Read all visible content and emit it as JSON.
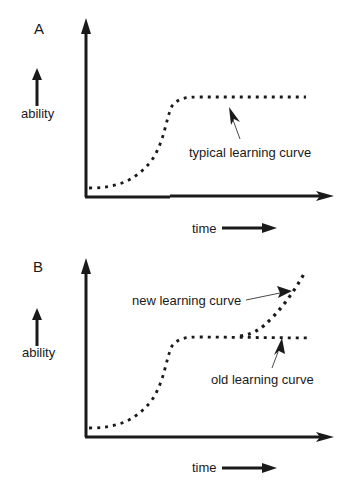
{
  "panels": [
    {
      "id": "A",
      "label": "A",
      "y_axis_label": "ability",
      "x_axis_label": "time",
      "annotations": [
        {
          "text": "typical learning curve",
          "points_to": "plateau"
        }
      ]
    },
    {
      "id": "B",
      "label": "B",
      "y_axis_label": "ability",
      "x_axis_label": "time",
      "annotations": [
        {
          "text": "new learning curve",
          "points_to": "rising branch"
        },
        {
          "text": "old learning curve",
          "points_to": "plateau"
        }
      ]
    }
  ],
  "colors": {
    "ink": "#1a1a1a",
    "background": "#ffffff"
  }
}
